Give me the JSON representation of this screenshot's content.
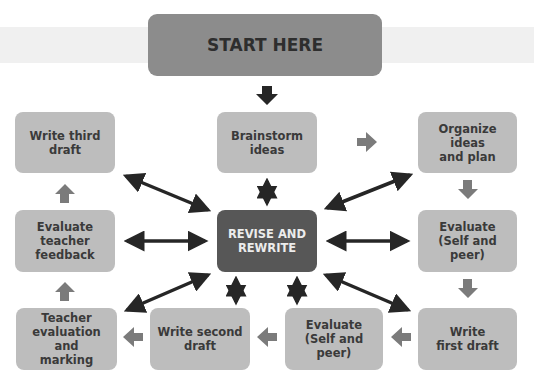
{
  "page": {
    "cut_text_top": "...ing and writing process..."
  },
  "diagram": {
    "start": {
      "label": "START HERE"
    },
    "center": {
      "label": "REVISE AND\nREWRITE"
    },
    "steps": [
      {
        "id": "brainstorm",
        "label": "Brainstorm\nideas"
      },
      {
        "id": "organize",
        "label": "Organize ideas\nand plan"
      },
      {
        "id": "evaluate-1",
        "label": "Evaluate\n(Self and peer)"
      },
      {
        "id": "write-first",
        "label": "Write\nfirst draft"
      },
      {
        "id": "evaluate-2",
        "label": "Evaluate\n(Self and peer)"
      },
      {
        "id": "write-second",
        "label": "Write second\ndraft"
      },
      {
        "id": "teacher-eval",
        "label": "Teacher\nevaluation and\nmarking"
      },
      {
        "id": "evaluate-teacher",
        "label": "Evaluate\nteacher\nfeedback"
      },
      {
        "id": "write-third",
        "label": "Write third\ndraft"
      }
    ],
    "colors": {
      "box": "#bdbdbd",
      "start": "#8c8c8c",
      "center": "#575757",
      "flow_arrow": "#7b7b7b",
      "connector": "#262626"
    }
  }
}
